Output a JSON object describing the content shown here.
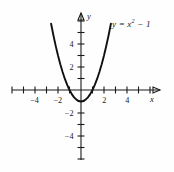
{
  "figure": {
    "title": "",
    "equation_label": "y = x",
    "equation_exponent": "2",
    "equation_tail": " − 1",
    "x_axis_name": "x",
    "y_axis_name": "y"
  },
  "chart_data": {
    "type": "line",
    "title": "",
    "subtitle": "",
    "xlabel": "x",
    "ylabel": "y",
    "function": "y = x^2 - 1",
    "xlim": [
      -6,
      5
    ],
    "ylim": [
      -5,
      6
    ],
    "xticks": [
      -4,
      -2,
      2,
      4
    ],
    "yticks": [
      4,
      2,
      -2,
      -4
    ],
    "xtick_labels": [
      "−4",
      "−2",
      "2",
      "4"
    ],
    "ytick_labels": [
      "4",
      "2",
      "−2",
      "−4"
    ],
    "minor_tick_spacing": 1,
    "grid": false,
    "legend": "none",
    "annotations": [
      {
        "text": "y = x² − 1",
        "x": 3.0,
        "y": 5.6
      }
    ],
    "vertex": {
      "x": 0,
      "y": -1
    },
    "roots": [
      -1,
      1
    ],
    "series": [
      {
        "name": "y = x^2 - 1",
        "x": [
          -2.6,
          -2.4,
          -2.2,
          -2.0,
          -1.8,
          -1.6,
          -1.4,
          -1.2,
          -1.0,
          -0.8,
          -0.6,
          -0.4,
          -0.2,
          0.0,
          0.2,
          0.4,
          0.6,
          0.8,
          1.0,
          1.2,
          1.4,
          1.6,
          1.8,
          2.0,
          2.2,
          2.4,
          2.6
        ],
        "values": [
          5.76,
          4.76,
          3.84,
          3.0,
          2.24,
          1.56,
          0.96,
          0.44,
          0.0,
          -0.36,
          -0.64,
          -0.84,
          -0.96,
          -1.0,
          -0.96,
          -0.84,
          -0.64,
          -0.36,
          0.0,
          0.44,
          0.96,
          1.56,
          2.24,
          3.0,
          3.84,
          4.76,
          5.76
        ]
      }
    ]
  }
}
